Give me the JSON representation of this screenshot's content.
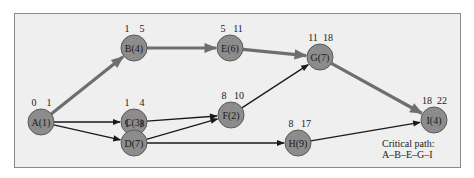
{
  "diagram": {
    "colors": {
      "background": "#efefef",
      "border": "#8a8a8a",
      "node_fill": "#8c8c8c",
      "node_stroke": "#5a5a5a",
      "critical_edge": "#6e6e6e",
      "normal_edge": "#1a1a1a"
    },
    "nodes": [
      {
        "id": "A",
        "label": "A(1)",
        "es": "0",
        "ef": "1",
        "x": 41,
        "y": 122
      },
      {
        "id": "B",
        "label": "B(4)",
        "es": "1",
        "ef": "5",
        "x": 134,
        "y": 48
      },
      {
        "id": "C",
        "label": "C(3)",
        "es": "1",
        "ef": "4",
        "x": 134,
        "y": 122
      },
      {
        "id": "D",
        "label": "D(7)",
        "es": "1",
        "ef": "8",
        "x": 134,
        "y": 143
      },
      {
        "id": "E",
        "label": "E(6)",
        "es": "5",
        "ef": "11",
        "x": 230,
        "y": 48
      },
      {
        "id": "F",
        "label": "F(2)",
        "es": "8",
        "ef": "10",
        "x": 231,
        "y": 115
      },
      {
        "id": "G",
        "label": "G(7)",
        "es": "11",
        "ef": "18",
        "x": 320,
        "y": 57
      },
      {
        "id": "H",
        "label": "H(9)",
        "es": "8",
        "ef": "17",
        "x": 298,
        "y": 143
      },
      {
        "id": "I",
        "label": "I(4)",
        "es": "18",
        "ef": "22",
        "x": 434,
        "y": 120
      }
    ],
    "edges": [
      {
        "from": "A",
        "to": "B",
        "critical": true
      },
      {
        "from": "B",
        "to": "E",
        "critical": true
      },
      {
        "from": "E",
        "to": "G",
        "critical": true
      },
      {
        "from": "G",
        "to": "I",
        "critical": true
      },
      {
        "from": "A",
        "to": "C",
        "critical": false
      },
      {
        "from": "A",
        "to": "D",
        "critical": false
      },
      {
        "from": "C",
        "to": "F",
        "critical": false
      },
      {
        "from": "D",
        "to": "F",
        "critical": false
      },
      {
        "from": "D",
        "to": "H",
        "critical": false
      },
      {
        "from": "F",
        "to": "G",
        "critical": false
      },
      {
        "from": "H",
        "to": "I",
        "critical": false
      }
    ],
    "legend": {
      "line1": "Critical path:",
      "line2": "A–B–E–G–I"
    }
  }
}
